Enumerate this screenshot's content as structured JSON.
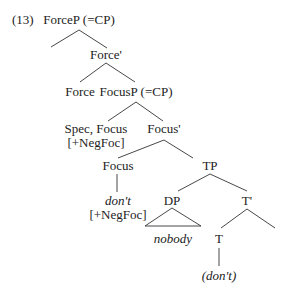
{
  "example_number": "(13)",
  "tree": {
    "nodes": {
      "forcep": "ForceP (=CP)",
      "force_bar": "Force'",
      "force": "Force",
      "focusp": "FocusP (=CP)",
      "spec_focus": "Spec, Focus",
      "spec_focus_feature": "[+NegFoc]",
      "focus_bar": "Focus'",
      "focus": "Focus",
      "focus_word": "don't",
      "focus_feature": "[+NegFoc]",
      "tp": "TP",
      "dp": "DP",
      "dp_word": "nobody",
      "t_bar": "T'",
      "t": "T",
      "t_word": "(don't)"
    },
    "edges": [
      [
        "ForceP (=CP)",
        "(empty specifier)"
      ],
      [
        "ForceP (=CP)",
        "Force'"
      ],
      [
        "Force'",
        "Force"
      ],
      [
        "Force'",
        "FocusP (=CP)"
      ],
      [
        "FocusP (=CP)",
        "Spec, Focus"
      ],
      [
        "FocusP (=CP)",
        "Focus'"
      ],
      [
        "Focus'",
        "Focus"
      ],
      [
        "Focus'",
        "TP"
      ],
      [
        "Focus",
        "don't"
      ],
      [
        "TP",
        "DP"
      ],
      [
        "TP",
        "T'"
      ],
      [
        "DP",
        "nobody (triangle)"
      ],
      [
        "T'",
        "T"
      ],
      [
        "T'",
        "(empty complement)"
      ],
      [
        "T",
        "(don't)"
      ]
    ]
  }
}
